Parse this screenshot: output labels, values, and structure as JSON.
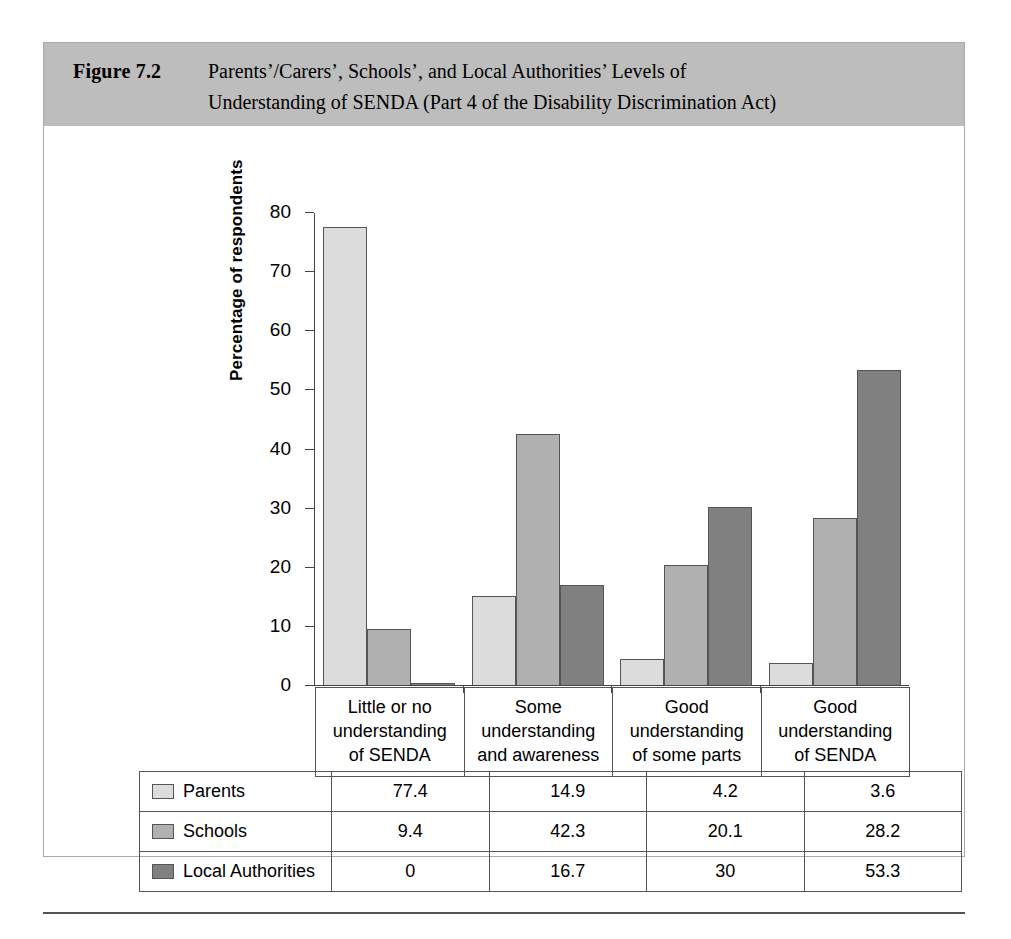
{
  "figure": {
    "number": "Figure 7.2",
    "title_line1": "Parents’/Carers’, Schools’, and Local Authorities’ Levels of",
    "title_line2": "Understanding of SENDA (Part 4 of the Disability Discrimination Act)"
  },
  "colors": {
    "header_band": "#bdbdbd",
    "series_parents": "#dcdcdc",
    "series_schools": "#b0b0b0",
    "series_local_authorities": "#808080",
    "axis": "#444444",
    "border": "#555555"
  },
  "chart_data": {
    "type": "bar",
    "title": "Parents’/Carers’, Schools’, and Local Authorities’ Levels of Understanding of SENDA (Part 4 of the Disability Discrimination Act)",
    "xlabel": "",
    "ylabel": "Percentage of respondents",
    "ylim": [
      0,
      80
    ],
    "yticks": [
      0,
      10,
      20,
      30,
      40,
      50,
      60,
      70,
      80
    ],
    "ytick_labels": [
      "0",
      "10",
      "20",
      "30",
      "40",
      "50",
      "60",
      "70",
      "80"
    ],
    "grid": false,
    "legend_position": "table-below",
    "categories": [
      "Little or no understanding of SENDA",
      "Some understanding and awareness",
      "Good understanding of some parts",
      "Good understanding of SENDA"
    ],
    "category_lines": [
      [
        "Little or no",
        "understanding",
        "of SENDA"
      ],
      [
        "Some",
        "understanding",
        "and awareness"
      ],
      [
        "Good",
        "understanding",
        "of some parts"
      ],
      [
        "Good",
        "understanding",
        "of SENDA"
      ]
    ],
    "series": [
      {
        "name": "Parents",
        "values": [
          77.4,
          14.9,
          4.2,
          3.6
        ],
        "labels": [
          "77.4",
          "14.9",
          "4.2",
          "3.6"
        ]
      },
      {
        "name": "Schools",
        "values": [
          9.4,
          42.3,
          20.1,
          28.2
        ],
        "labels": [
          "9.4",
          "42.3",
          "20.1",
          "28.2"
        ]
      },
      {
        "name": "Local Authorities",
        "values": [
          0,
          16.7,
          30,
          53.3
        ],
        "labels": [
          "0",
          "16.7",
          "30",
          "53.3"
        ]
      }
    ]
  }
}
